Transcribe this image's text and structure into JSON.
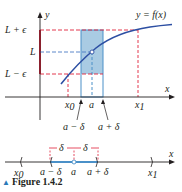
{
  "figure": {
    "caption_marker": "▲",
    "caption": "Figure 1.4.2",
    "top_graph": {
      "y_axis_label": "y",
      "x_axis_label": "x",
      "curve_label": "y = f(x)",
      "y_levels": {
        "upper": "L + ϵ",
        "middle": "L",
        "lower": "L − ϵ"
      },
      "x_ticks": {
        "x0": "x0",
        "a": "a",
        "x1": "x1"
      },
      "x0_sub": "0",
      "x1_sub": "1",
      "annot_left": "a − δ",
      "annot_right": "a + δ"
    },
    "number_line": {
      "x_axis_label": "x",
      "delta_left": "δ",
      "delta_right": "δ",
      "ticks": {
        "x0": "x",
        "x0_sub": "0",
        "a_minus": "a − δ",
        "a": "a",
        "a_plus": "a + δ",
        "x1": "x",
        "x1_sub": "1"
      }
    },
    "colors": {
      "curve": "#2d4fa3",
      "shade": "#a9cbe3",
      "shade_stroke": "#4a90c8",
      "red_dash": "#e0223a",
      "axis": "#231f20",
      "blue_dash": "#4a7cc4"
    }
  }
}
